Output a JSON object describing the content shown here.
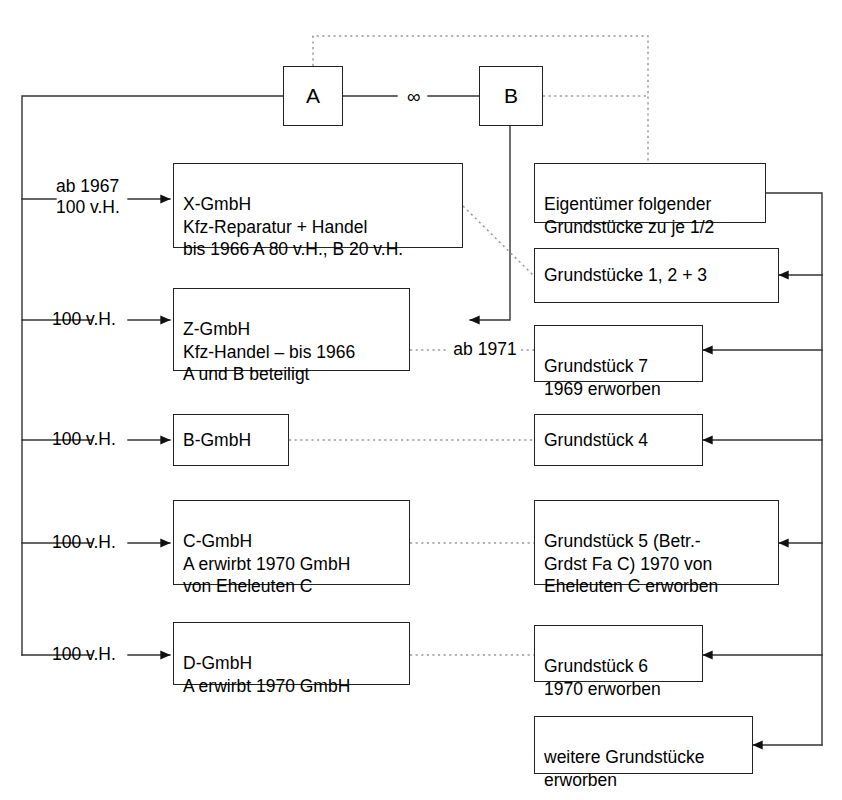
{
  "diagram": {
    "type": "organizational-flow-diagram",
    "line_colors": {
      "solid": "#333333",
      "dotted": "#999999"
    },
    "marriage_symbol": "∞"
  },
  "top_nodes": {
    "a": {
      "label": "A"
    },
    "b": {
      "label": "B"
    }
  },
  "left_labels": [
    {
      "id": "x",
      "text": "ab 1967\n100 v.H."
    },
    {
      "id": "z",
      "text": "100 v.H."
    },
    {
      "id": "b",
      "text": "100 v.H."
    },
    {
      "id": "c",
      "text": "100 v.H."
    },
    {
      "id": "d",
      "text": "100 v.H."
    }
  ],
  "company_boxes": [
    {
      "id": "x-gmbh",
      "text": "X-GmbH\nKfz-Reparatur + Handel\nbis 1966 A 80 v.H., B 20 v.H."
    },
    {
      "id": "z-gmbh",
      "text": "Z-GmbH\nKfz-Handel – bis 1966\nA und B beteiligt"
    },
    {
      "id": "b-gmbh",
      "text": "B-GmbH"
    },
    {
      "id": "c-gmbh",
      "text": "C-GmbH\nA erwirbt 1970 GmbH\nvon Eheleuten C"
    },
    {
      "id": "d-gmbh",
      "text": "D-GmbH\nA erwirbt 1970 GmbH"
    }
  ],
  "property_boxes": [
    {
      "id": "eigentuemer",
      "text": "Eigentümer folgender\nGrundstücke zu je 1/2"
    },
    {
      "id": "grundstuecke-123",
      "text": "Grundstücke 1, 2 + 3"
    },
    {
      "id": "grundstueck-7",
      "text": "Grundstück 7\n1969 erworben"
    },
    {
      "id": "grundstueck-4",
      "text": "Grundstück 4"
    },
    {
      "id": "grundstueck-5",
      "text": "Grundstück 5 (Betr.-\nGrdst Fa C) 1970 von\n Eheleuten C erworben"
    },
    {
      "id": "grundstueck-6",
      "text": "Grundstück 6\n1970 erworben"
    },
    {
      "id": "weitere",
      "text": "weitere Grundstücke\nerworben"
    }
  ],
  "edge_labels": [
    {
      "id": "ab-1971",
      "text": "ab 1971"
    }
  ]
}
